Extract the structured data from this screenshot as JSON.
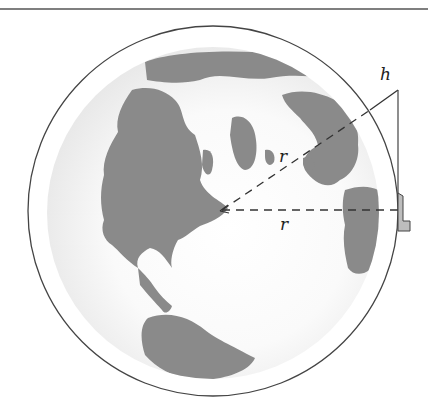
{
  "figure": {
    "type": "diagram",
    "labels": {
      "height": "h",
      "radius_slant": "r",
      "radius_horizontal": "r"
    },
    "colors": {
      "land": "#8a8a8a",
      "ocean_glow": "#ececec",
      "ocean_center": "#ffffff",
      "line": "#444444",
      "tower_fill": "#bdbdbd"
    }
  }
}
